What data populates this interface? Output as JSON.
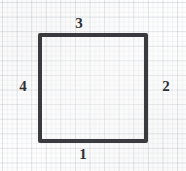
{
  "figure": {
    "shape": {
      "name": "square",
      "stroke_color": "#3b3b3f",
      "stroke_width_px": 4,
      "fill": "none",
      "x_px": 38,
      "y_px": 33,
      "width_px": 110,
      "height_px": 110
    },
    "background": {
      "paper_color": "#fdfdfd",
      "grid_color": "#969eaa",
      "grid_major_spacing_px": 14.6,
      "grid_minor_spacing_px": 4.87
    },
    "labels": {
      "top": "3",
      "right": "2",
      "bottom": "1",
      "left": "4"
    }
  }
}
